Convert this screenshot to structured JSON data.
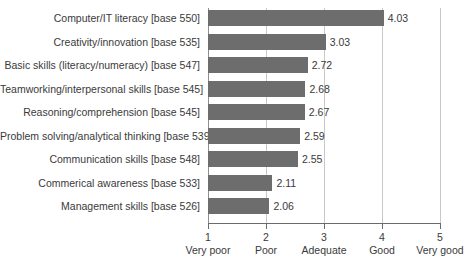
{
  "chart_data": {
    "type": "bar",
    "orientation": "horizontal",
    "title": "",
    "subtitle": "",
    "xlabel": "",
    "ylabel": "",
    "xlim": [
      1,
      5
    ],
    "grid": true,
    "legend": null,
    "categories": [
      "Computer/IT literacy [base 550]",
      "Creativity/innovation [base 535]",
      "Basic skills (literacy/numeracy) [base 547]",
      "Teamworking/interpersonal skills [base 545]",
      "Reasoning/comprehension [base 545]",
      "Problem solving/analytical thinking [base 539]",
      "Communication skills [base 548]",
      "Commerical awareness [base 533]",
      "Management skills [base 526]"
    ],
    "values": [
      4.03,
      3.03,
      2.72,
      2.68,
      2.67,
      2.59,
      2.55,
      2.11,
      2.06
    ],
    "value_labels": [
      "4.03",
      "3.03",
      "2.72",
      "2.68",
      "2.67",
      "2.59",
      "2.55",
      "2.11",
      "2.06"
    ],
    "x_ticks": [
      1,
      2,
      3,
      4,
      5
    ],
    "x_tick_labels": [
      "1",
      "2",
      "3",
      "4",
      "5"
    ],
    "x_tick_captions": [
      "Very poor",
      "Poor",
      "Adequate",
      "Good",
      "Very good"
    ],
    "bar_color": "#6d6d6d",
    "gridline_color": "#c9c9c9",
    "axis_color": "#6b6b6b",
    "text_color": "#3a3a3a",
    "background_color": "#ffffff"
  }
}
